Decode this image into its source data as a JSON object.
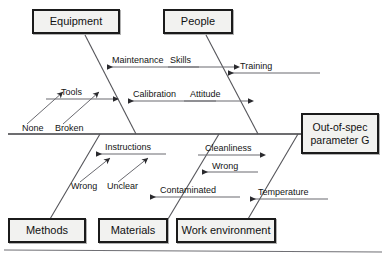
{
  "diagram": {
    "type": "fishbone-ishikawa",
    "title_text": "",
    "colors": {
      "box_fill": "#f2f2f0",
      "box_border": "#1b1b1b",
      "line": "#55555a",
      "spine": "#3c3c40",
      "text": "#111111"
    },
    "effect": {
      "line1": "Out-of-spec",
      "line2": "parameter G",
      "full": "Out-of-spec parameter G"
    },
    "categories": [
      {
        "id": "equipment",
        "label": "Equipment",
        "position": "top-left"
      },
      {
        "id": "people",
        "label": "People",
        "position": "top-right"
      },
      {
        "id": "methods",
        "label": "Methods",
        "position": "bottom-left"
      },
      {
        "id": "materials",
        "label": "Materials",
        "position": "bottom-center"
      },
      {
        "id": "work-environment",
        "label": "Work environment",
        "position": "bottom-right"
      }
    ],
    "causes": [
      {
        "id": "maintenance",
        "label": "Maintenance",
        "category": "equipment",
        "direction": "left"
      },
      {
        "id": "calibration",
        "label": "Calibration",
        "category": "equipment",
        "direction": "left"
      },
      {
        "id": "tools",
        "label": "Tools",
        "category": "equipment",
        "direction": "right"
      },
      {
        "id": "skills",
        "label": "Skills",
        "category": "people",
        "direction": "right"
      },
      {
        "id": "training",
        "label": "Training",
        "category": "people",
        "direction": "left"
      },
      {
        "id": "attitude",
        "label": "Attitude",
        "category": "people",
        "direction": "right"
      },
      {
        "id": "instructions",
        "label": "Instructions",
        "category": "methods",
        "direction": "left"
      },
      {
        "id": "cleanliness",
        "label": "Cleanliness",
        "category": "materials",
        "direction": "right"
      },
      {
        "id": "wrong-material",
        "label": "Wrong",
        "category": "materials",
        "direction": "left"
      },
      {
        "id": "contaminated",
        "label": "Contaminated",
        "category": "materials",
        "direction": "left"
      },
      {
        "id": "temperature",
        "label": "Temperature",
        "category": "work-environment",
        "direction": "left"
      }
    ],
    "sub_causes": [
      {
        "id": "none",
        "label": "None",
        "parent": "tools"
      },
      {
        "id": "broken",
        "label": "Broken",
        "parent": "tools"
      },
      {
        "id": "wrong-instructions",
        "label": "Wrong",
        "parent": "instructions"
      },
      {
        "id": "unclear",
        "label": "Unclear",
        "parent": "instructions"
      }
    ]
  }
}
